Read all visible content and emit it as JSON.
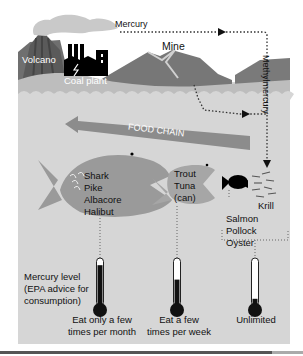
{
  "diagram": {
    "colors": {
      "water": "#d6d6d6",
      "land": "#7a7a7a",
      "land_light": "#a9a9a9",
      "fish_large": "#9a9a9a",
      "fish_small": "#000000",
      "mercury_fill": "#111111",
      "arrow": "#8c8c8c"
    },
    "sources": {
      "volcano": "Volcano",
      "coal_plant": "Coal plant",
      "mine": "Mine"
    },
    "flows": {
      "mercury": "Mercury",
      "methylmercury": "Methylmercury",
      "food_chain": "FOOD CHAIN"
    },
    "fish": {
      "large": [
        "Shark",
        "Pike",
        "Albacore",
        "Halibut"
      ],
      "medium": [
        "Trout",
        "Tuna",
        "(can)"
      ],
      "small": [
        "Salmon",
        "Pollock",
        "Oyster"
      ],
      "krill": "Krill"
    },
    "legend": {
      "title_lines": [
        "Mercury level",
        "(EPA advice for",
        "consumption)"
      ]
    },
    "thermometers": [
      {
        "level_pct": 85,
        "label_lines": [
          "Eat only a few",
          "times per month"
        ]
      },
      {
        "level_pct": 55,
        "label_lines": [
          "Eat a few",
          "times per week"
        ]
      },
      {
        "level_pct": 15,
        "label_lines": [
          "Unlimited"
        ]
      }
    ]
  }
}
